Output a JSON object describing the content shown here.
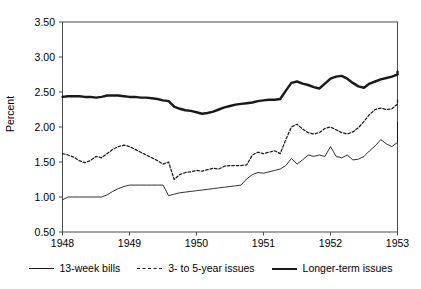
{
  "chart_data": {
    "type": "line",
    "title": "",
    "xlabel": "",
    "ylabel": "Percent",
    "xlim": [
      1948.0,
      1953.0
    ],
    "ylim": [
      0.5,
      3.5
    ],
    "grid": false,
    "legend_position": "bottom",
    "yticks": [
      "0.50",
      "1.00",
      "1.50",
      "2.00",
      "2.50",
      "3.00",
      "3.50"
    ],
    "ytick_values": [
      0.5,
      1.0,
      1.5,
      2.0,
      2.5,
      3.0,
      3.5
    ],
    "xticks": [
      "1948",
      "1949",
      "1950",
      "1951",
      "1952",
      "1953"
    ],
    "xtick_values": [
      1948,
      1949,
      1950,
      1951,
      1952,
      1953
    ],
    "x": [
      1948.0,
      1948.083,
      1948.167,
      1948.25,
      1948.333,
      1948.417,
      1948.5,
      1948.583,
      1948.667,
      1948.75,
      1948.833,
      1948.917,
      1949.0,
      1949.083,
      1949.167,
      1949.25,
      1949.333,
      1949.417,
      1949.5,
      1949.583,
      1949.667,
      1949.75,
      1949.833,
      1949.917,
      1950.0,
      1950.083,
      1950.167,
      1950.25,
      1950.333,
      1950.417,
      1950.5,
      1950.583,
      1950.667,
      1950.75,
      1950.833,
      1950.917,
      1951.0,
      1951.083,
      1951.167,
      1951.25,
      1951.333,
      1951.417,
      1951.5,
      1951.583,
      1951.667,
      1951.75,
      1951.833,
      1951.917,
      1952.0,
      1952.083,
      1952.167,
      1952.25,
      1952.333,
      1952.417,
      1952.5,
      1952.583,
      1952.667,
      1952.75,
      1952.833,
      1952.917,
      1953.0
    ],
    "series": [
      {
        "name": "13-week bills",
        "style": "thin-solid",
        "color": "#1a1a1a",
        "values": [
          0.96,
          1.0,
          1.0,
          1.0,
          1.0,
          1.0,
          1.0,
          1.0,
          1.03,
          1.08,
          1.12,
          1.15,
          1.17,
          1.17,
          1.17,
          1.17,
          1.17,
          1.17,
          1.17,
          1.02,
          1.04,
          1.06,
          1.07,
          1.08,
          1.09,
          1.1,
          1.11,
          1.12,
          1.13,
          1.14,
          1.15,
          1.16,
          1.17,
          1.26,
          1.32,
          1.35,
          1.34,
          1.36,
          1.38,
          1.4,
          1.45,
          1.55,
          1.47,
          1.53,
          1.6,
          1.58,
          1.6,
          1.58,
          1.72,
          1.58,
          1.56,
          1.6,
          1.53,
          1.54,
          1.58,
          1.66,
          1.73,
          1.82,
          1.76,
          1.72,
          1.78
        ]
      },
      {
        "name": "3- to 5-year issues",
        "style": "dashed",
        "color": "#1a1a1a",
        "values": [
          1.62,
          1.6,
          1.57,
          1.52,
          1.49,
          1.52,
          1.58,
          1.56,
          1.62,
          1.68,
          1.72,
          1.74,
          1.72,
          1.68,
          1.64,
          1.6,
          1.56,
          1.52,
          1.47,
          1.5,
          1.25,
          1.32,
          1.35,
          1.36,
          1.38,
          1.37,
          1.39,
          1.41,
          1.4,
          1.44,
          1.45,
          1.45,
          1.45,
          1.46,
          1.6,
          1.64,
          1.62,
          1.64,
          1.66,
          1.62,
          1.82,
          2.0,
          2.04,
          1.97,
          1.92,
          1.9,
          1.92,
          1.98,
          2.0,
          1.96,
          1.92,
          1.9,
          1.93,
          1.99,
          2.08,
          2.18,
          2.25,
          2.27,
          2.25,
          2.26,
          2.33
        ]
      },
      {
        "name": "Longer-term issues",
        "style": "thick-solid",
        "color": "#1a1a1a",
        "values": [
          2.43,
          2.44,
          2.44,
          2.44,
          2.43,
          2.43,
          2.42,
          2.43,
          2.45,
          2.45,
          2.45,
          2.44,
          2.43,
          2.43,
          2.42,
          2.42,
          2.41,
          2.4,
          2.38,
          2.37,
          2.29,
          2.26,
          2.24,
          2.23,
          2.21,
          2.19,
          2.2,
          2.22,
          2.25,
          2.28,
          2.3,
          2.32,
          2.33,
          2.34,
          2.35,
          2.37,
          2.38,
          2.39,
          2.39,
          2.4,
          2.52,
          2.63,
          2.65,
          2.62,
          2.6,
          2.57,
          2.55,
          2.62,
          2.69,
          2.72,
          2.73,
          2.69,
          2.63,
          2.58,
          2.56,
          2.62,
          2.65,
          2.68,
          2.7,
          2.72,
          2.75
        ]
      }
    ],
    "series_end_extra": {
      "13-week bills": [
        2.07,
        1.9
      ],
      "3- to 5-year issues": [
        2.39,
        2.37
      ],
      "Longer-term issues": [
        2.78,
        2.79
      ]
    }
  },
  "axis": {
    "ylabel": "Percent"
  },
  "legend": {
    "items": [
      {
        "label": "13-week bills",
        "style": "sw-thin"
      },
      {
        "label": "3- to 5-year issues",
        "style": "sw-dashed"
      },
      {
        "label": "Longer-term issues",
        "style": "sw-thick"
      }
    ]
  }
}
